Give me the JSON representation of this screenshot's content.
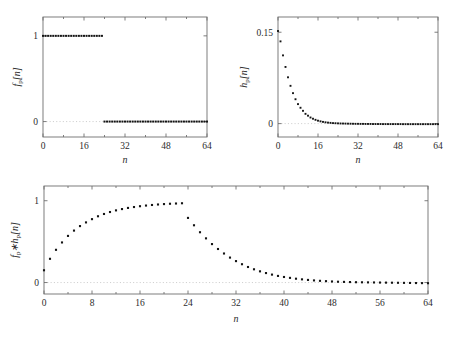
{
  "figure": {
    "caption": "",
    "panel_count": 3
  },
  "axis_titles": {
    "x": "n",
    "y_top_left": "f",
    "y_top_right": "h",
    "y_bottom": "f"
  },
  "labels": {
    "fp_sub": "p",
    "hp_sub": "p",
    "bracket_open": "[",
    "bracket_close": "]",
    "index": "n",
    "conv_symbol": "∗"
  },
  "chart_data": [
    {
      "id": "panel-fp",
      "type": "scatter",
      "title": "",
      "xlabel": "n",
      "ylabel": "f_p[n]",
      "xlim": [
        0,
        64
      ],
      "ylim": [
        -0.18,
        1.22
      ],
      "xticks": [
        0,
        16,
        32,
        48,
        64
      ],
      "xticklabels": [
        "0",
        "16",
        "32",
        "48",
        "64"
      ],
      "yticks": [
        0,
        1
      ],
      "yticklabels": [
        "0",
        "1"
      ],
      "grid": false,
      "zero_reference_line": true,
      "marker": "square-dot",
      "marker_color": "#141414",
      "description": "Rectangular pulse: value 1 for n = 0..23, value 0 for n = 24..64",
      "x": [
        0,
        1,
        2,
        3,
        4,
        5,
        6,
        7,
        8,
        9,
        10,
        11,
        12,
        13,
        14,
        15,
        16,
        17,
        18,
        19,
        20,
        21,
        22,
        23,
        24,
        25,
        26,
        27,
        28,
        29,
        30,
        31,
        32,
        33,
        34,
        35,
        36,
        37,
        38,
        39,
        40,
        41,
        42,
        43,
        44,
        45,
        46,
        47,
        48,
        49,
        50,
        51,
        52,
        53,
        54,
        55,
        56,
        57,
        58,
        59,
        60,
        61,
        62,
        63,
        64
      ],
      "values": [
        1,
        1,
        1,
        1,
        1,
        1,
        1,
        1,
        1,
        1,
        1,
        1,
        1,
        1,
        1,
        1,
        1,
        1,
        1,
        1,
        1,
        1,
        1,
        1,
        0,
        0,
        0,
        0,
        0,
        0,
        0,
        0,
        0,
        0,
        0,
        0,
        0,
        0,
        0,
        0,
        0,
        0,
        0,
        0,
        0,
        0,
        0,
        0,
        0,
        0,
        0,
        0,
        0,
        0,
        0,
        0,
        0,
        0,
        0,
        0,
        0,
        0,
        0,
        0,
        0
      ]
    },
    {
      "id": "panel-hp",
      "type": "scatter",
      "title": "",
      "xlabel": "n",
      "ylabel": "h_p[n]",
      "xlim": [
        0,
        64
      ],
      "ylim": [
        -0.022,
        0.175
      ],
      "xticks": [
        0,
        16,
        32,
        48,
        64
      ],
      "xticklabels": [
        "0",
        "16",
        "32",
        "48",
        "64"
      ],
      "yticks": [
        0,
        0.15
      ],
      "yticklabels": [
        "0",
        "0.15"
      ],
      "grid": false,
      "zero_reference_line": true,
      "marker": "square-dot",
      "marker_color": "#141414",
      "description": "Exponentially decaying impulse response starting at 0.15, decay ratio ~0.78 per sample, settling slightly below zero",
      "x": [
        0,
        1,
        2,
        3,
        4,
        5,
        6,
        7,
        8,
        9,
        10,
        11,
        12,
        13,
        14,
        15,
        16,
        17,
        18,
        19,
        20,
        21,
        22,
        23,
        24,
        25,
        26,
        27,
        28,
        29,
        30,
        31,
        32,
        33,
        34,
        35,
        36,
        37,
        38,
        39,
        40,
        41,
        42,
        43,
        44,
        45,
        46,
        47,
        48,
        49,
        50,
        51,
        52,
        53,
        54,
        55,
        56,
        57,
        58,
        59,
        60,
        61,
        62,
        63,
        64
      ],
      "values": [
        0.152,
        0.135,
        0.112,
        0.093,
        0.076,
        0.062,
        0.05,
        0.04,
        0.032,
        0.026,
        0.021,
        0.016,
        0.013,
        0.01,
        0.008,
        0.0062,
        0.0048,
        0.0037,
        0.0028,
        0.0021,
        0.0016,
        0.0012,
        0.0008,
        0.0006,
        0.0004,
        0.0002,
        0.0001,
        0,
        -0.0001,
        -0.0002,
        -0.0003,
        -0.0004,
        -0.0004,
        -0.0005,
        -0.0005,
        -0.0006,
        -0.0006,
        -0.0006,
        -0.0007,
        -0.0007,
        -0.0007,
        -0.0007,
        -0.0008,
        -0.0008,
        -0.0008,
        -0.0008,
        -0.0008,
        -0.0008,
        -0.0008,
        -0.0008,
        -0.0009,
        -0.0009,
        -0.0009,
        -0.0009,
        -0.0009,
        -0.0009,
        -0.0009,
        -0.0009,
        -0.0009,
        -0.0009,
        -0.0009,
        -0.0009,
        -0.0009,
        -0.0009,
        -0.0009
      ]
    },
    {
      "id": "panel-conv",
      "type": "scatter",
      "title": "",
      "xlabel": "n",
      "ylabel": "f_p * h_p[n]",
      "xlim": [
        0,
        64
      ],
      "ylim": [
        -0.14,
        1.18
      ],
      "xticks": [
        0,
        8,
        16,
        24,
        32,
        40,
        48,
        56,
        64
      ],
      "xticklabels": [
        "0",
        "8",
        "16",
        "24",
        "32",
        "40",
        "48",
        "56",
        "64"
      ],
      "yticks": [
        0,
        1
      ],
      "yticklabels": [
        "0",
        "1"
      ],
      "grid": false,
      "zero_reference_line": true,
      "marker": "square-dot",
      "marker_color": "#141414",
      "description": "Circular convolution of the rectangular pulse with the decaying impulse response: saturating rise to ~0.97 by n=23, sharp drop at n=24, then exponential decay to slightly below zero",
      "x": [
        0,
        1,
        2,
        3,
        4,
        5,
        6,
        7,
        8,
        9,
        10,
        11,
        12,
        13,
        14,
        15,
        16,
        17,
        18,
        19,
        20,
        21,
        22,
        23,
        24,
        25,
        26,
        27,
        28,
        29,
        30,
        31,
        32,
        33,
        34,
        35,
        36,
        37,
        38,
        39,
        40,
        41,
        42,
        43,
        44,
        45,
        46,
        47,
        48,
        49,
        50,
        51,
        52,
        53,
        54,
        55,
        56,
        57,
        58,
        59,
        60,
        61,
        62,
        63,
        64
      ],
      "values": [
        0.15,
        0.29,
        0.4,
        0.49,
        0.57,
        0.635,
        0.69,
        0.735,
        0.775,
        0.81,
        0.838,
        0.862,
        0.882,
        0.898,
        0.912,
        0.923,
        0.933,
        0.941,
        0.948,
        0.954,
        0.959,
        0.963,
        0.966,
        0.969,
        0.79,
        0.7,
        0.615,
        0.54,
        0.47,
        0.41,
        0.355,
        0.305,
        0.262,
        0.224,
        0.19,
        0.162,
        0.137,
        0.116,
        0.097,
        0.081,
        0.068,
        0.057,
        0.047,
        0.039,
        0.032,
        0.026,
        0.021,
        0.017,
        0.013,
        0.01,
        0.008,
        0.006,
        0.004,
        0.003,
        0.002,
        0.001,
        0,
        -0.001,
        -0.002,
        -0.003,
        -0.004,
        -0.005,
        -0.006,
        -0.007,
        -0.008
      ]
    }
  ]
}
